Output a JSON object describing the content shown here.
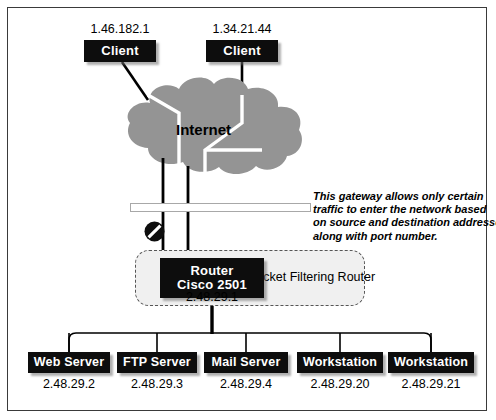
{
  "diagram": {
    "colors": {
      "cloud_fill": "#949494",
      "node_fill": "#0d0d0d",
      "node_text": "#ffffff",
      "zone_fill": "#f0f0f0",
      "zone_border": "#555555",
      "line": "#000000",
      "frame": "#3a3a3a",
      "bar_fill": "#ffffff",
      "bar_border": "#a8a8a8"
    },
    "cloud": {
      "label": "Internet",
      "icon": "cloud-icon"
    },
    "clients": [
      {
        "ip": "1.46.182.1",
        "label": "Client"
      },
      {
        "ip": "1.34.21.44",
        "label": "Client"
      }
    ],
    "gateway": {
      "icon": "no-entry-icon",
      "bar": "filter-bar",
      "annotation": [
        "This gateway allows only certain",
        "traffic to enter the network based",
        "on source and destination addresses",
        "along with port number."
      ]
    },
    "router": {
      "line1": "Router",
      "line2": "Cisco 2501",
      "ip": "2.48.29.1",
      "zone_label": "Packet Filtering Router"
    },
    "devices": [
      {
        "label": "Web Server",
        "ip": "2.48.29.2"
      },
      {
        "label": "FTP Server",
        "ip": "2.48.29.3"
      },
      {
        "label": "Mail Server",
        "ip": "2.48.29.4"
      },
      {
        "label": "Workstation",
        "ip": "2.48.29.20"
      },
      {
        "label": "Workstation",
        "ip": "2.48.29.21"
      }
    ]
  }
}
